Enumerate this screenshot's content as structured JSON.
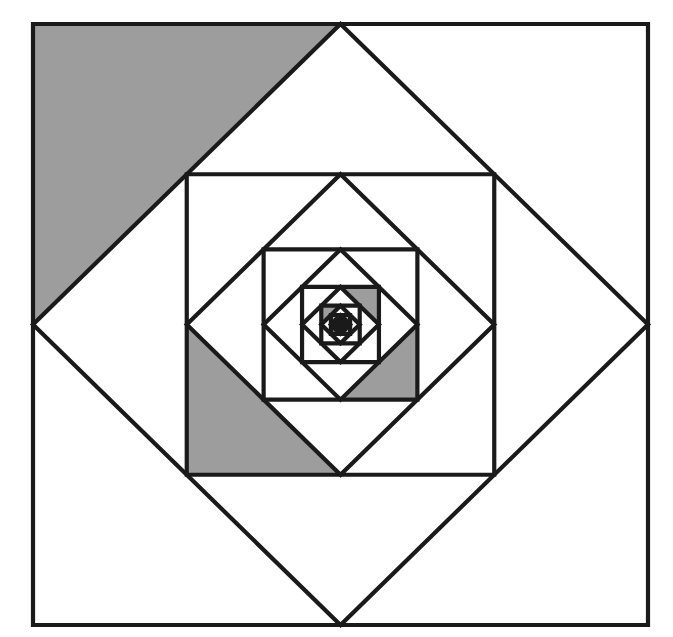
{
  "figure": {
    "name": "nested-rotating-squares",
    "title": "Nested squares and inscribed diamonds with shaded corner triangles",
    "canvas": {
      "width": 673,
      "height": 637
    },
    "colors": {
      "background": "#ffffff",
      "stroke": "#1a1a1a",
      "shade": "#9d9d9d"
    },
    "stroke_width": 4.2,
    "outer_square": {
      "left": 33,
      "top": 24,
      "right": 648,
      "bottom": 625,
      "width": 615,
      "height": 601,
      "center_x": 340.5,
      "center_y": 324.5
    },
    "levels": 8,
    "scale_per_level": 0.7071,
    "rotation_per_level_deg": 45,
    "shaded_corner_sequence": [
      "nw",
      "sw",
      "se",
      "ne",
      "nw",
      "sw",
      "se",
      "ne"
    ]
  },
  "chart_data": {
    "type": "diagram",
    "title": "Nested squares and inscribed diamonds with shaded corner triangles",
    "series": [
      {
        "level": 1,
        "shape": "square",
        "half_width": 307.5,
        "half_height": 300.5,
        "rotation_deg": 0,
        "shaded_corner": "nw"
      },
      {
        "level": 1,
        "shape": "diamond",
        "half_width": 307.5,
        "half_height": 300.5,
        "rotation_deg": 45,
        "shaded_corner": null
      },
      {
        "level": 2,
        "shape": "square",
        "half_width": 153.75,
        "half_height": 150.25,
        "rotation_deg": 0,
        "shaded_corner": "sw"
      },
      {
        "level": 2,
        "shape": "diamond",
        "half_width": 153.75,
        "half_height": 150.25,
        "rotation_deg": 45,
        "shaded_corner": null
      },
      {
        "level": 3,
        "shape": "square",
        "half_width": 76.88,
        "half_height": 75.13,
        "rotation_deg": 0,
        "shaded_corner": "se"
      },
      {
        "level": 3,
        "shape": "diamond",
        "half_width": 76.88,
        "half_height": 75.13,
        "rotation_deg": 45,
        "shaded_corner": null
      },
      {
        "level": 4,
        "shape": "square",
        "half_width": 38.44,
        "half_height": 37.56,
        "rotation_deg": 0,
        "shaded_corner": "ne"
      },
      {
        "level": 4,
        "shape": "diamond",
        "half_width": 38.44,
        "half_height": 37.56,
        "rotation_deg": 45,
        "shaded_corner": null
      },
      {
        "level": 5,
        "shape": "square",
        "half_width": 19.22,
        "half_height": 18.78,
        "rotation_deg": 0,
        "shaded_corner": "nw"
      },
      {
        "level": 5,
        "shape": "diamond",
        "half_width": 19.22,
        "half_height": 18.78,
        "rotation_deg": 45,
        "shaded_corner": null
      },
      {
        "level": 6,
        "shape": "square",
        "half_width": 9.61,
        "half_height": 9.39,
        "rotation_deg": 0,
        "shaded_corner": "sw"
      },
      {
        "level": 6,
        "shape": "diamond",
        "half_width": 9.61,
        "half_height": 9.39,
        "rotation_deg": 45,
        "shaded_corner": null
      }
    ],
    "xlabel": "",
    "ylabel": "",
    "grid": false,
    "legend": false
  }
}
